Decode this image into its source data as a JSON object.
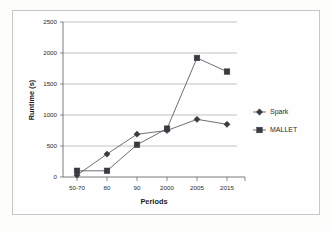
{
  "chart_data": {
    "type": "line",
    "title": "",
    "xlabel": "Periods",
    "ylabel": "Runtime (s)",
    "categories": [
      "50-70",
      "80",
      "90",
      "2000",
      "2005",
      "2015"
    ],
    "ylim": [
      0,
      2500
    ],
    "ytick_labels": [
      "0",
      "500",
      "1000",
      "1500",
      "2000",
      "2500"
    ],
    "ytick_values": [
      0,
      500,
      1000,
      1500,
      2000,
      2500
    ],
    "grid": "horizontal",
    "legend_position": "right",
    "series": [
      {
        "name": "Spark",
        "marker": "diamond",
        "values": [
          30,
          370,
          690,
          750,
          930,
          850
        ]
      },
      {
        "name": "MALLET",
        "marker": "square",
        "values": [
          100,
          100,
          520,
          780,
          1920,
          1700
        ]
      }
    ]
  },
  "legend": {
    "items": [
      {
        "label": "Spark",
        "marker": "diamond-marker"
      },
      {
        "label": "MALLET",
        "marker": "square-marker"
      }
    ]
  },
  "axes": {
    "x_title": "Periods",
    "y_title": "Runtime (s)"
  }
}
